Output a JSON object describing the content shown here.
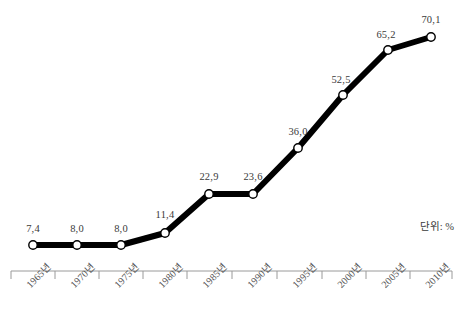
{
  "chart_data": {
    "type": "line",
    "title": "",
    "subtitle": "",
    "xlabel": "",
    "ylabel": "",
    "unit_note": "단위: %",
    "grid": false,
    "legend": "none",
    "axis": {
      "x_axis_visible": true,
      "y_axis_visible": false,
      "ticks_visible": true
    },
    "categories": [
      "1965년",
      "1970년",
      "1975년",
      "1980년",
      "1985년",
      "1990년",
      "1995년",
      "2000년",
      "2005년",
      "2010년"
    ],
    "values": [
      7.4,
      8.0,
      8.0,
      11.4,
      22.9,
      23.6,
      36.0,
      52.5,
      65.2,
      70.1
    ],
    "data_labels": [
      "7,4",
      "8,0",
      "8,0",
      "11,4",
      "22,9",
      "23,6",
      "36,0",
      "52,5",
      "65,2",
      "70,1"
    ],
    "ylim": [
      0,
      78
    ],
    "series": [
      {
        "name": "",
        "values": [
          7.4,
          8.0,
          8.0,
          11.4,
          22.9,
          23.6,
          36.0,
          52.5,
          65.2,
          70.1
        ]
      }
    ],
    "style": {
      "line_color": "#000000",
      "line_width": 6,
      "marker": "circle-open",
      "marker_fill": "#ffffff",
      "marker_edge": "#000000",
      "axis_color": "#9a9a9a",
      "label_color": "#3a3a3a",
      "background": "#ffffff"
    }
  },
  "geometry": {
    "points": [
      {
        "x": 33,
        "y": 245,
        "label_x": 33,
        "label_y": 223
      },
      {
        "x": 77,
        "y": 245,
        "label_x": 77,
        "label_y": 223
      },
      {
        "x": 121,
        "y": 245,
        "label_x": 121,
        "label_y": 223
      },
      {
        "x": 165,
        "y": 233,
        "label_x": 165,
        "label_y": 209
      },
      {
        "x": 209,
        "y": 194,
        "label_x": 209,
        "label_y": 171
      },
      {
        "x": 253,
        "y": 194,
        "label_x": 253,
        "label_y": 171
      },
      {
        "x": 298,
        "y": 148,
        "label_x": 298,
        "label_y": 126
      },
      {
        "x": 343,
        "y": 95,
        "label_x": 341,
        "label_y": 74
      },
      {
        "x": 388,
        "y": 50,
        "label_x": 386,
        "label_y": 29
      },
      {
        "x": 431,
        "y": 37,
        "label_x": 431,
        "label_y": 14
      }
    ],
    "axis_y": 271,
    "axis_x_start": 11,
    "axis_x_end": 452,
    "tick_xs": [
      11,
      55,
      99,
      143,
      187,
      232,
      277,
      322,
      366,
      410,
      452
    ],
    "tick_label_xs": [
      22,
      66,
      110,
      154,
      198,
      243,
      288,
      333,
      377,
      421
    ],
    "tick_label_y": 280
  }
}
